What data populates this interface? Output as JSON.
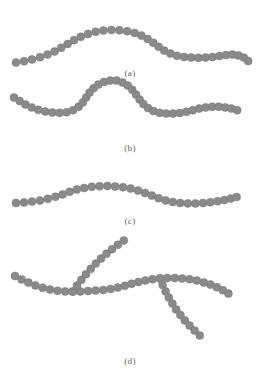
{
  "figure": {
    "width": 263,
    "height": 382,
    "background": "#ffffff",
    "top_clipped_text": "                                      ",
    "bead_color": "#8a8a8a",
    "bead_edge_color": "#7a7a7a",
    "bond_color": "#8f8f8f",
    "caption_color": "#5f5f5f"
  },
  "panels": [
    {
      "id": "a",
      "caption": "(a)",
      "caption_x": 110,
      "caption_y": 68,
      "description": "linear bead-spring chain, single broad hump",
      "bead_radius": 4.0,
      "chains": [
        {
          "name": "chain-a-main",
          "points": [
            [
              16,
              62.5
            ],
            [
              24,
              61.2
            ],
            [
              32,
              59.4
            ],
            [
              40,
              57.2
            ],
            [
              47.5,
              54.6
            ],
            [
              54.6,
              51.4
            ],
            [
              61.2,
              47.8
            ],
            [
              67.6,
              44.0
            ],
            [
              74.0,
              40.2
            ],
            [
              80.8,
              36.8
            ],
            [
              88.0,
              34.0
            ],
            [
              95.6,
              31.8
            ],
            [
              103.4,
              30.6
            ],
            [
              111.4,
              30.0
            ],
            [
              119.4,
              30.2
            ],
            [
              127.2,
              31.2
            ],
            [
              134.6,
              33.0
            ],
            [
              141.4,
              35.6
            ],
            [
              147.6,
              39.0
            ],
            [
              153.2,
              42.8
            ],
            [
              158.6,
              46.8
            ],
            [
              164.2,
              50.6
            ],
            [
              170.4,
              53.6
            ],
            [
              177.0,
              55.8
            ],
            [
              184.0,
              57.0
            ],
            [
              191.2,
              57.6
            ],
            [
              198.4,
              57.8
            ],
            [
              205.6,
              57.6
            ],
            [
              212.6,
              57.0
            ],
            [
              219.4,
              56.0
            ],
            [
              226.0,
              55.0
            ],
            [
              232.4,
              54.6
            ],
            [
              238.4,
              55.4
            ],
            [
              243.8,
              57.6
            ],
            [
              248.2,
              61.0
            ]
          ]
        }
      ]
    },
    {
      "id": "b",
      "caption": "(b)",
      "caption_x": 110,
      "caption_y": 143,
      "description": "linear bead-spring chain, sinusoidal with deep valley and sharp peak",
      "bead_radius": 4.0,
      "chains": [
        {
          "name": "chain-b-main",
          "points": [
            [
              14,
              97.5
            ],
            [
              19.6,
              101.0
            ],
            [
              25.4,
              104.4
            ],
            [
              31.6,
              107.4
            ],
            [
              38.2,
              109.8
            ],
            [
              45.2,
              111.6
            ],
            [
              52.4,
              112.6
            ],
            [
              59.6,
              112.8
            ],
            [
              66.6,
              112.2
            ],
            [
              73.0,
              110.2
            ],
            [
              78.6,
              106.8
            ],
            [
              82.8,
              102.4
            ],
            [
              86.2,
              97.4
            ],
            [
              89.6,
              92.6
            ],
            [
              93.6,
              88.2
            ],
            [
              98.4,
              84.6
            ],
            [
              104.0,
              82.0
            ],
            [
              110.2,
              80.6
            ],
            [
              116.6,
              80.6
            ],
            [
              122.6,
              82.4
            ],
            [
              127.8,
              85.6
            ],
            [
              132.2,
              89.8
            ],
            [
              136.0,
              94.6
            ],
            [
              139.6,
              99.4
            ],
            [
              143.4,
              104.0
            ],
            [
              148.0,
              108.0
            ],
            [
              153.4,
              111.0
            ],
            [
              159.6,
              112.8
            ],
            [
              166.2,
              113.6
            ],
            [
              173.0,
              113.6
            ],
            [
              179.8,
              113.0
            ],
            [
              186.4,
              111.8
            ],
            [
              192.8,
              110.2
            ],
            [
              199.2,
              108.6
            ],
            [
              205.6,
              107.4
            ],
            [
              212.2,
              106.8
            ],
            [
              218.8,
              106.8
            ],
            [
              225.2,
              107.4
            ],
            [
              231.4,
              108.6
            ],
            [
              237.2,
              110.2
            ]
          ]
        }
      ]
    },
    {
      "id": "c",
      "caption": "(c)",
      "caption_x": 110,
      "caption_y": 216,
      "description": "linear bead-spring chain, shallow single wave",
      "bead_radius": 4.0,
      "chains": [
        {
          "name": "chain-c-main",
          "points": [
            [
              16,
              203.0
            ],
            [
              24,
              202.4
            ],
            [
              32,
              201.6
            ],
            [
              40,
              200.4
            ],
            [
              47.8,
              198.8
            ],
            [
              55.4,
              196.8
            ],
            [
              62.6,
              194.4
            ],
            [
              69.6,
              191.8
            ],
            [
              76.8,
              189.6
            ],
            [
              84.2,
              188.0
            ],
            [
              91.8,
              186.8
            ],
            [
              99.6,
              186.2
            ],
            [
              107.4,
              186.0
            ],
            [
              115.2,
              186.4
            ],
            [
              123.0,
              187.2
            ],
            [
              130.6,
              188.6
            ],
            [
              138.0,
              190.6
            ],
            [
              145.0,
              193.0
            ],
            [
              151.8,
              195.6
            ],
            [
              158.6,
              198.2
            ],
            [
              165.6,
              200.4
            ],
            [
              172.8,
              202.0
            ],
            [
              180.2,
              203.0
            ],
            [
              187.8,
              203.4
            ],
            [
              195.4,
              203.4
            ],
            [
              203.0,
              203.0
            ],
            [
              210.4,
              202.2
            ],
            [
              217.6,
              201.2
            ],
            [
              224.4,
              200.0
            ],
            [
              230.8,
              198.6
            ],
            [
              236.6,
              197.0
            ]
          ]
        }
      ]
    },
    {
      "id": "d",
      "caption": "(d)",
      "caption_x": 110,
      "caption_y": 356,
      "description": "branched bead-spring chain: backbone with two side branches",
      "bead_radius": 4.0,
      "chains": [
        {
          "name": "chain-d-backbone",
          "points": [
            [
              15,
              276.0
            ],
            [
              21.6,
              279.4
            ],
            [
              28.4,
              282.6
            ],
            [
              35.4,
              285.4
            ],
            [
              42.6,
              287.8
            ],
            [
              50.0,
              289.6
            ],
            [
              57.6,
              290.8
            ],
            [
              65.2,
              291.4
            ],
            [
              72.8,
              291.6
            ],
            [
              80.4,
              291.4
            ],
            [
              88.0,
              291.0
            ],
            [
              95.6,
              290.6
            ],
            [
              103.2,
              290.0
            ],
            [
              110.6,
              289.0
            ],
            [
              117.8,
              287.6
            ],
            [
              124.8,
              285.8
            ],
            [
              131.6,
              283.8
            ],
            [
              138.4,
              282.0
            ],
            [
              145.4,
              280.4
            ],
            [
              152.6,
              279.2
            ],
            [
              160.0,
              278.4
            ],
            [
              167.4,
              278.0
            ],
            [
              174.8,
              278.0
            ],
            [
              182.2,
              278.4
            ],
            [
              189.6,
              279.2
            ],
            [
              196.8,
              280.6
            ],
            [
              203.8,
              282.4
            ],
            [
              210.4,
              284.6
            ],
            [
              216.8,
              287.2
            ],
            [
              222.8,
              290.2
            ],
            [
              228.4,
              293.6
            ]
          ]
        },
        {
          "name": "chain-d-branch-upper",
          "attach_index": 8,
          "points": [
            [
              72.8,
              291.6
            ],
            [
              77.0,
              285.6
            ],
            [
              81.4,
              279.8
            ],
            [
              86.0,
              274.2
            ],
            [
              90.8,
              268.8
            ],
            [
              95.8,
              263.6
            ],
            [
              101.0,
              258.6
            ],
            [
              106.4,
              253.8
            ],
            [
              112.0,
              249.2
            ],
            [
              117.8,
              244.8
            ],
            [
              123.8,
              240.6
            ]
          ]
        },
        {
          "name": "chain-d-branch-lower",
          "attach_index": 20,
          "points": [
            [
              160.0,
              278.4
            ],
            [
              162.6,
              285.0
            ],
            [
              165.6,
              291.4
            ],
            [
              168.8,
              297.6
            ],
            [
              172.4,
              303.6
            ],
            [
              176.2,
              309.4
            ],
            [
              180.4,
              315.0
            ],
            [
              184.8,
              320.4
            ],
            [
              189.6,
              325.6
            ],
            [
              194.6,
              330.6
            ],
            [
              199.8,
              335.4
            ]
          ]
        }
      ]
    }
  ]
}
